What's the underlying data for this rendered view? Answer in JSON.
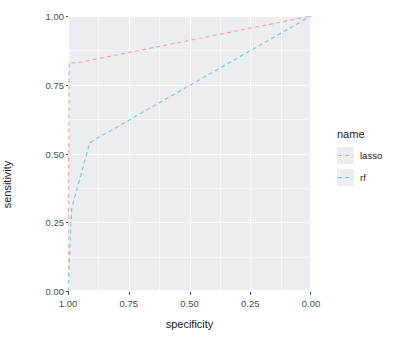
{
  "chart_data": {
    "type": "line",
    "title": "",
    "xlabel": "specificity",
    "ylabel": "sensitivity",
    "xlim": [
      1.0,
      0.0
    ],
    "ylim": [
      0.0,
      1.0
    ],
    "x_reversed": true,
    "grid": true,
    "legend_position": "right",
    "legend_title": "name",
    "x_ticks": [
      "1.00",
      "0.75",
      "0.50",
      "0.25",
      "0.00"
    ],
    "x_tick_values": [
      1.0,
      0.75,
      0.5,
      0.25,
      0.0
    ],
    "y_ticks": [
      "0.00",
      "0.25",
      "0.50",
      "0.75",
      "1.00"
    ],
    "y_tick_values": [
      0.0,
      0.25,
      0.5,
      0.75,
      1.0
    ],
    "series": [
      {
        "name": "lasso",
        "color": "#f8a6a4",
        "linestyle": "dashed",
        "points": [
          {
            "specificity": 1.0,
            "sensitivity": 0.0
          },
          {
            "specificity": 0.995,
            "sensitivity": 0.83
          },
          {
            "specificity": 0.96,
            "sensitivity": 0.83
          },
          {
            "specificity": 0.0,
            "sensitivity": 1.0
          }
        ]
      },
      {
        "name": "rf",
        "color": "#86c5da",
        "linestyle": "dashed",
        "points": [
          {
            "specificity": 1.0,
            "sensitivity": 0.0
          },
          {
            "specificity": 0.985,
            "sensitivity": 0.3
          },
          {
            "specificity": 0.91,
            "sensitivity": 0.54
          },
          {
            "specificity": 0.0,
            "sensitivity": 1.0
          }
        ]
      }
    ]
  },
  "legend": {
    "title": "name",
    "items": [
      {
        "label": "lasso",
        "color": "#f8a6a4"
      },
      {
        "label": "rf",
        "color": "#86c5da"
      }
    ]
  },
  "axes": {
    "x_title": "specificity",
    "y_title": "sensitivity"
  },
  "colors": {
    "panel_background": "#ebedf0",
    "gridline": "#ffffff",
    "page_background": "#ffffff",
    "tick_text": "#4d4d4d",
    "title_text": "#1a1a1a",
    "lasso": "#f8a6a4",
    "rf": "#86c5da"
  }
}
